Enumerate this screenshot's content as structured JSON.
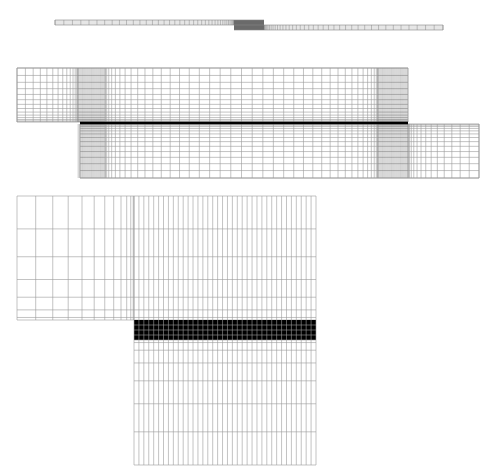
{
  "figure": {
    "views": [
      {
        "name": "overall-joint",
        "upper_adherend": {
          "x0": 55,
          "x1": 264,
          "y0": 20,
          "y1": 25
        },
        "lower_adherend": {
          "x0": 234,
          "x1": 443,
          "y0": 25,
          "y1": 30
        },
        "overlap": {
          "x0": 234,
          "x1": 264
        }
      },
      {
        "name": "overlap-region",
        "upper_adherend": {
          "x0": 17,
          "x1": 408,
          "y0": 68,
          "y1": 122
        },
        "lower_adherend": {
          "x0": 80,
          "x1": 479,
          "y0": 124,
          "y1": 178
        },
        "adhesive_line": {
          "x0": 80,
          "x1": 408,
          "y": 123
        },
        "dense_zones": [
          [
            78,
            105
          ],
          [
            378,
            408
          ]
        ]
      },
      {
        "name": "overlap-end-detail",
        "upper_adherend": {
          "x0": 17,
          "x1": 316,
          "y0": 196,
          "y1": 320
        },
        "adhesive_layer": {
          "x0": 134,
          "x1": 316,
          "y0": 320,
          "y1": 340
        },
        "lower_adherend": {
          "x0": 134,
          "x1": 316,
          "y0": 340,
          "y1": 465
        }
      }
    ],
    "colors": {
      "mesh_line": "#9a9a9a",
      "dense_line": "#555555",
      "adhesive": "#000000",
      "adhesive_grid": "#9a9a9a",
      "background": "#ffffff"
    }
  }
}
